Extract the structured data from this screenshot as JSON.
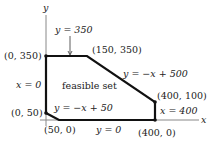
{
  "diagram": {
    "type": "linear-programming-feasible-region",
    "axes": {
      "x_label": "x",
      "y_label": "y"
    },
    "region_label": "feasible set",
    "vertices": [
      {
        "label": "(0, 350)",
        "x": 0,
        "y": 350
      },
      {
        "label": "(150, 350)",
        "x": 150,
        "y": 350
      },
      {
        "label": "(400, 100)",
        "x": 400,
        "y": 100
      },
      {
        "label": "(400, 0)",
        "x": 400,
        "y": 0
      },
      {
        "label": "(50, 0)",
        "x": 50,
        "y": 0
      },
      {
        "label": "(0, 50)",
        "x": 0,
        "y": 50
      }
    ],
    "constraints": [
      {
        "label": "y = 350"
      },
      {
        "label": "y = −x + 500"
      },
      {
        "label": "x = 400"
      },
      {
        "label": "y = 0"
      },
      {
        "label": "y = −x + 50"
      },
      {
        "label": "x = 0"
      }
    ],
    "colors": {
      "edge": "#111111",
      "axis": "#888888",
      "text": "#222222"
    }
  }
}
